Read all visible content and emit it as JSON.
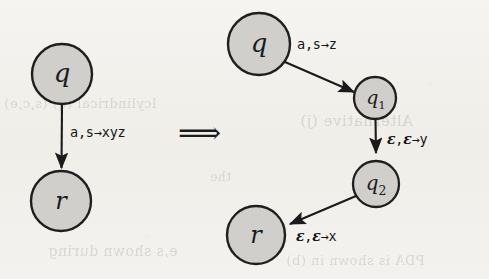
{
  "figure": {
    "kind": "pushdown-automaton-transition-equivalence",
    "background_color": "#f2f1ed",
    "ink_color": "#1b1b1b",
    "node_fill_color": "#d0cfcb",
    "implies_symbol": "⟹"
  },
  "left_diagram": {
    "nodes": [
      {
        "id": "q",
        "label": "q",
        "sub": "",
        "cx": 62,
        "cy": 74,
        "r": 30
      },
      {
        "id": "r",
        "label": "r",
        "sub": "",
        "cx": 61,
        "cy": 201,
        "r": 30
      }
    ],
    "edges": [
      {
        "from": "q",
        "to": "r",
        "label": "a,s→xyz"
      }
    ]
  },
  "right_diagram": {
    "nodes": [
      {
        "id": "q",
        "label": "q",
        "sub": "",
        "cx": 259,
        "cy": 44,
        "r": 31
      },
      {
        "id": "q1",
        "label": "q",
        "sub": "1",
        "cx": 375,
        "cy": 98,
        "r": 21
      },
      {
        "id": "q2",
        "label": "q",
        "sub": "2",
        "cx": 376,
        "cy": 184,
        "r": 23
      },
      {
        "id": "r",
        "label": "r",
        "sub": "",
        "cx": 256,
        "cy": 235,
        "r": 29
      }
    ],
    "edges": [
      {
        "from": "q",
        "to": "q1",
        "label": "a,s→z"
      },
      {
        "from": "q1",
        "to": "q2",
        "label": "ε,ε→y"
      },
      {
        "from": "q2",
        "to": "r",
        "label": "ε,ε→x"
      }
    ]
  },
  "labels": {
    "left_edge_label": "a,s→xyz",
    "right_edge_1": "a,s→z",
    "right_edge_2_prefix": "ε",
    "right_edge_2_mid": ",",
    "right_edge_2_tail": "→y",
    "right_edge_3_tail": "→x",
    "implies": "⟹"
  },
  "ghost_text": [
    {
      "text": "lcylindrical (q) (s,c,e)",
      "x": 4,
      "y": 96,
      "size": 13
    },
    {
      "text": "e,s shown during",
      "x": 48,
      "y": 243,
      "size": 14
    },
    {
      "text": "Alternative (j)",
      "x": 300,
      "y": 112,
      "size": 15
    },
    {
      "text": "PDA is shown in (b)",
      "x": 286,
      "y": 253,
      "size": 13
    },
    {
      "text": "the",
      "x": 210,
      "y": 170,
      "size": 12
    }
  ]
}
